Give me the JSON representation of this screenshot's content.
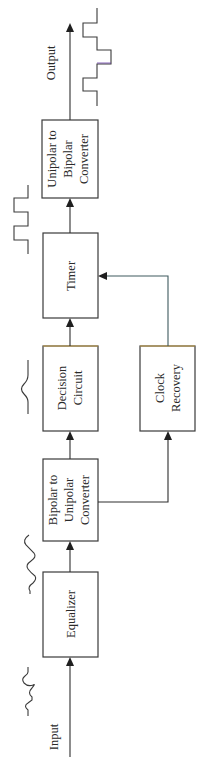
{
  "diagram": {
    "orientation": "rotated-90-ccw",
    "input_label": "Input",
    "output_label": "Output",
    "blocks": [
      {
        "id": "equalizer",
        "lines": [
          "Equalizer"
        ]
      },
      {
        "id": "bipolar_to_unipolar",
        "lines": [
          "Bipolar to",
          "Unipolar",
          "Converter"
        ]
      },
      {
        "id": "decision_circuit",
        "lines": [
          "Decision",
          "Circuit"
        ]
      },
      {
        "id": "timer",
        "lines": [
          "Timer"
        ]
      },
      {
        "id": "unipolar_to_bipolar",
        "lines": [
          "Unipolar to",
          "Bipolar",
          "Converter"
        ]
      },
      {
        "id": "clock_recovery",
        "lines": [
          "Clock",
          "Recovery"
        ]
      }
    ],
    "connections": [
      {
        "from": "input",
        "to": "equalizer"
      },
      {
        "from": "equalizer",
        "to": "bipolar_to_unipolar"
      },
      {
        "from": "bipolar_to_unipolar",
        "to": "decision_circuit"
      },
      {
        "from": "bipolar_to_unipolar",
        "to": "clock_recovery"
      },
      {
        "from": "decision_circuit",
        "to": "timer"
      },
      {
        "from": "clock_recovery",
        "to": "timer"
      },
      {
        "from": "timer",
        "to": "unipolar_to_bipolar"
      },
      {
        "from": "unipolar_to_bipolar",
        "to": "output"
      }
    ],
    "waveforms": [
      {
        "position": "input",
        "shape": "distorted-bipolar-pulse"
      },
      {
        "position": "after-equalizer",
        "shape": "equalized-bipolar-pulse"
      },
      {
        "position": "after-bipolar-to-unipolar",
        "shape": "unipolar-smooth-pulse"
      },
      {
        "position": "after-timer",
        "shape": "unipolar-square-pulses"
      },
      {
        "position": "output",
        "shape": "bipolar-square-pulses"
      }
    ],
    "colors": {
      "line": "#2e2e2e",
      "clock_line": "#3f5a5e",
      "box_border": "#3a3a3a",
      "background": "#ffffff"
    }
  }
}
